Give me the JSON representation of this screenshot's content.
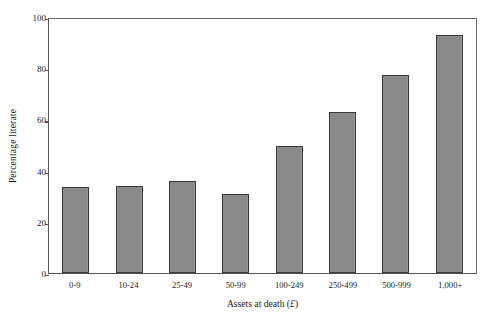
{
  "chart_data": {
    "type": "bar",
    "title": "",
    "subtitle": "",
    "xlabel": "Assets at death (£)",
    "xlabel_text": "Assets at death (",
    "xlabel_currency": "£",
    "xlabel_close": ")",
    "ylabel": "Percentage literate",
    "categories": [
      "0-9",
      "10-24",
      "25-49",
      "50-99",
      "100-249",
      "250-499",
      "500-999",
      "1,000+"
    ],
    "values": [
      33.5,
      34.0,
      36.0,
      31.0,
      49.5,
      63.0,
      77.5,
      93.0
    ],
    "ylim": [
      0,
      100
    ],
    "yticks": [
      0,
      20,
      40,
      60,
      80,
      100
    ],
    "ytick_labels": [
      "0",
      "20",
      "40",
      "60",
      "80",
      "100"
    ],
    "grid": false,
    "legend": null,
    "bar_fill_color": "#8a8a8a",
    "bar_edge_color": "#3a3a3c",
    "axis_color": "#55565a",
    "background_color": "#ffffff"
  }
}
